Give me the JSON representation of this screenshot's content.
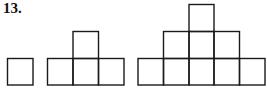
{
  "problem": {
    "number": "13."
  },
  "figures": [
    {
      "name": "figure-1",
      "squares": 1,
      "rows": [
        1
      ]
    },
    {
      "name": "figure-2",
      "squares": 4,
      "rows": [
        1,
        3
      ]
    },
    {
      "name": "figure-3",
      "squares": 9,
      "rows": [
        1,
        3,
        5
      ]
    }
  ],
  "style": {
    "stroke_color": "#1a1a1a",
    "background": "#ffffff"
  }
}
